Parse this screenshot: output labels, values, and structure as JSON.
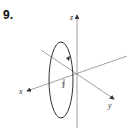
{
  "problem": {
    "number": "9."
  },
  "diagram": {
    "type": "3d-axes-with-circle",
    "axes": {
      "z_label": "z",
      "x_label": "x",
      "y_label": "y"
    },
    "radius_label": "1",
    "colors": {
      "axis": "#777777",
      "curve": "#333333",
      "text": "#333333"
    }
  }
}
